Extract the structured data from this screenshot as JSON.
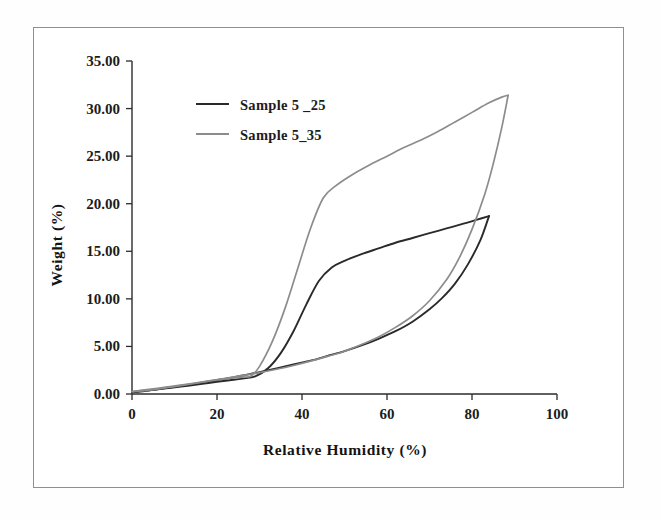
{
  "figure": {
    "background_color": "#ffffff",
    "border_color": "#8f8f8f"
  },
  "chart_data": {
    "type": "line",
    "title": "",
    "xlabel": "Relative Humidity (%)",
    "ylabel": "Weight (%)",
    "xlim": [
      0,
      100
    ],
    "ylim": [
      0,
      35
    ],
    "xticks": [
      0,
      20,
      40,
      60,
      80,
      100
    ],
    "xtick_labels": [
      "0",
      "20",
      "40",
      "60",
      "80",
      "100"
    ],
    "yticks": [
      0,
      5,
      10,
      15,
      20,
      25,
      30,
      35
    ],
    "ytick_labels": [
      "0.00",
      "5.00",
      "10.00",
      "15.00",
      "20.00",
      "25.00",
      "30.00",
      "35.00"
    ],
    "grid": false,
    "legend_position": "upper-left-inside",
    "series": [
      {
        "name": "Sample 5 _25",
        "color": "#2a2a2a",
        "linewidth": 1.9,
        "branches": [
          {
            "branch": "adsorption",
            "x": [
              0,
              2,
              5,
              8,
              11,
              14,
              17,
              20,
              23,
              26,
              29,
              32,
              35,
              38,
              41,
              44,
              47,
              50,
              54,
              58,
              62,
              66,
              70,
              74,
              78,
              81,
              84
            ],
            "y": [
              0.2,
              0.3,
              0.45,
              0.6,
              0.75,
              0.92,
              1.1,
              1.28,
              1.45,
              1.62,
              1.85,
              2.7,
              4.3,
              6.6,
              9.4,
              11.9,
              13.3,
              14.0,
              14.7,
              15.3,
              15.9,
              16.4,
              16.9,
              17.4,
              17.9,
              18.3,
              18.7
            ]
          },
          {
            "branch": "desorption",
            "x": [
              84,
              82,
              79,
              76,
              73,
              70,
              66,
              62,
              58,
              54,
              50,
              46,
              42,
              38,
              34,
              30,
              26,
              22,
              18,
              14,
              10,
              6,
              3,
              0
            ],
            "y": [
              18.7,
              16.2,
              13.6,
              11.6,
              10.1,
              8.9,
              7.6,
              6.6,
              5.8,
              5.1,
              4.5,
              4.0,
              3.5,
              3.1,
              2.7,
              2.3,
              1.95,
              1.6,
              1.3,
              1.0,
              0.75,
              0.5,
              0.32,
              0.2
            ]
          }
        ]
      },
      {
        "name": "Sample 5_35",
        "color": "#8c8c8c",
        "linewidth": 1.7,
        "branches": [
          {
            "branch": "adsorption",
            "x": [
              0,
              2,
              5,
              8,
              11,
              14,
              17,
              20,
              23,
              26,
              28,
              30,
              33,
              36,
              39,
              42,
              45,
              48,
              52,
              56,
              60,
              64,
              68,
              72,
              76,
              80,
              84,
              87,
              88.5
            ],
            "y": [
              0.25,
              0.38,
              0.55,
              0.72,
              0.9,
              1.1,
              1.3,
              1.5,
              1.65,
              1.78,
              1.9,
              2.9,
              5.5,
              9.0,
              13.2,
              17.4,
              20.6,
              21.9,
              23.1,
              24.1,
              25.0,
              25.9,
              26.7,
              27.6,
              28.6,
              29.6,
              30.6,
              31.2,
              31.4
            ]
          },
          {
            "branch": "desorption",
            "x": [
              88.5,
              87,
              85,
              83,
              80,
              77,
              74,
              70,
              66,
              62,
              58,
              54,
              50,
              46,
              42,
              38,
              34,
              30,
              26,
              22,
              18,
              14,
              10,
              6,
              3,
              0
            ],
            "y": [
              31.4,
              28.0,
              24.2,
              21.0,
              17.3,
              14.3,
              12.0,
              9.8,
              8.2,
              7.0,
              6.0,
              5.2,
              4.5,
              3.95,
              3.45,
              3.0,
              2.6,
              2.25,
              1.95,
              1.65,
              1.35,
              1.05,
              0.78,
              0.52,
              0.35,
              0.25
            ]
          }
        ]
      }
    ],
    "legend": [
      {
        "label": "Sample 5 _25",
        "color": "#2a2a2a"
      },
      {
        "label": "Sample 5_35",
        "color": "#8c8c8c"
      }
    ]
  }
}
